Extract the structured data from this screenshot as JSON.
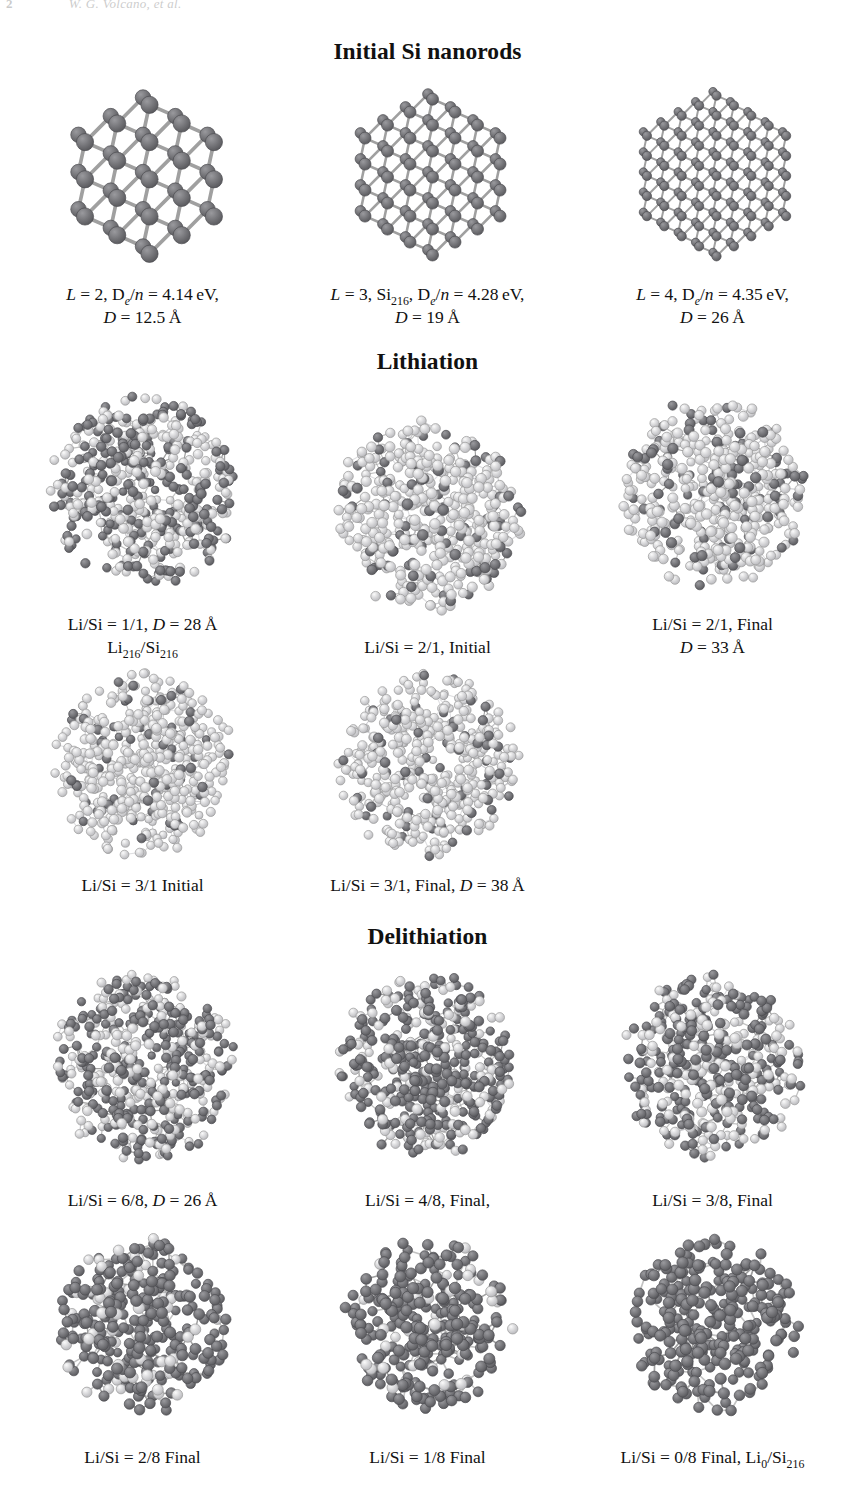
{
  "page": {
    "folio": "2",
    "running_head": "W. G. Volcano, et al."
  },
  "sections": [
    {
      "id": "initial",
      "title": "Initial Si nanorods"
    },
    {
      "id": "lithiation",
      "title": "Lithiation"
    },
    {
      "id": "delithiation",
      "title": "Delithiation"
    }
  ],
  "colors": {
    "silicon": "#76767a",
    "silicon_dark": "#5f5f63",
    "lithium": "#e2e2e2",
    "lithium_edge": "#9a9a9a",
    "bond": "#9b9b9b",
    "text": "#111111"
  },
  "structures": {
    "row1": [
      {
        "name": "si-nanorod-L2",
        "kind": "crystalline",
        "atoms": "Si",
        "caption_line1": "L = 2, D_e/n = 4.14 eV,",
        "caption_line2": "D = 12.5 Å",
        "L": "2",
        "De_n": "4.14 eV",
        "D": "12.5 Å"
      },
      {
        "name": "si-nanorod-L3",
        "kind": "crystalline",
        "atoms": "Si",
        "caption_line1": "L = 3, Si216, De/n = 4.28 eV,",
        "caption_line2": "D = 19 Å",
        "L": "3",
        "formula": "Si216",
        "De_n": "4.28 eV",
        "D": "19 Å"
      },
      {
        "name": "si-nanorod-L4",
        "kind": "crystalline",
        "atoms": "Si",
        "caption_line1": "L = 4, De/n = 4.35 eV,",
        "caption_line2": "D = 26 Å",
        "L": "4",
        "De_n": "4.35 eV",
        "D": "26 Å"
      }
    ],
    "row2": [
      {
        "name": "lithiation-1-1",
        "kind": "amorphous-mixed",
        "ratio": "1/1",
        "caption_line1": "Li/Si = 1/1, D = 28 Å",
        "caption_line2": "Li216/Si216",
        "D": "28 Å"
      },
      {
        "name": "lithiation-2-1-initial",
        "kind": "amorphous-li-rich",
        "ratio": "2/1",
        "state": "Initial",
        "caption_line1": "Li/Si = 2/1, Initial",
        "caption_line2": ""
      },
      {
        "name": "lithiation-2-1-final",
        "kind": "amorphous-li-rich",
        "ratio": "2/1",
        "state": "Final",
        "caption_line1": "Li/Si = 2/1, Final",
        "caption_line2": "D = 33 Å",
        "D": "33 Å"
      }
    ],
    "row3": [
      {
        "name": "lithiation-3-1-initial",
        "kind": "amorphous-li-rich",
        "ratio": "3/1",
        "state": "Initial",
        "caption_line1": "Li/Si = 3/1 Initial",
        "caption_line2": ""
      },
      {
        "name": "lithiation-3-1-final",
        "kind": "amorphous-li-rich",
        "ratio": "3/1",
        "state": "Final",
        "caption_line1": "Li/Si = 3/1, Final, D = 38 Å",
        "caption_line2": "",
        "D": "38 Å"
      }
    ],
    "row4": [
      {
        "name": "delithiation-6-8",
        "kind": "amorphous-mixed",
        "ratio": "6/8",
        "caption_line1": "Li/Si = 6/8, D = 26 Å",
        "caption_line2": "",
        "D": "26 Å"
      },
      {
        "name": "delithiation-4-8-final",
        "kind": "amorphous-mixed",
        "ratio": "4/8",
        "state": "Final",
        "caption_line1": "Li/Si = 4/8, Final,",
        "caption_line2": ""
      },
      {
        "name": "delithiation-3-8-final",
        "kind": "amorphous-mixed",
        "ratio": "3/8",
        "state": "Final",
        "caption_line1": "Li/Si = 3/8, Final",
        "caption_line2": ""
      }
    ],
    "row5": [
      {
        "name": "delithiation-2-8-final",
        "kind": "amorphous-si-rich",
        "ratio": "2/8",
        "state": "Final",
        "caption_line1": "Li/Si = 2/8 Final",
        "caption_line2": ""
      },
      {
        "name": "delithiation-1-8-final",
        "kind": "amorphous-si-rich",
        "ratio": "1/8",
        "state": "Final",
        "caption_line1": "Li/Si = 1/8 Final",
        "caption_line2": ""
      },
      {
        "name": "delithiation-0-8-final",
        "kind": "amorphous-si-only",
        "ratio": "0/8",
        "state": "Final",
        "caption_line1": "Li/Si = 0/8 Final, Li0/Si216",
        "caption_line2": "",
        "formula": "Li0/Si216"
      }
    ]
  }
}
